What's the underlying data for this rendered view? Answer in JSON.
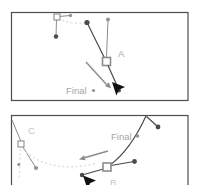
{
  "figure": {
    "panel1": {
      "anchor_label": "A",
      "final_label": "Final"
    },
    "panel2": {
      "anchor_label_c": "C",
      "final_label": "Final",
      "anchor_label_b": "B"
    },
    "icons": {
      "cursor": "solid-arrowhead-selection-cursor",
      "drag_arrow": "grey-drag-direction-arrow",
      "anchor": "hollow-square-anchor-point",
      "handle_dot": "round-direction-handle-dot"
    }
  },
  "colors": {
    "frame": "#4d4d4d",
    "dark": "#4a4a4a",
    "mid": "#8c8c8c",
    "light": "#d9d9d9",
    "label": "#a6a6a6",
    "label_light": "#c4c4c4",
    "dot_mid": "#949494",
    "cursor": "#111111"
  }
}
